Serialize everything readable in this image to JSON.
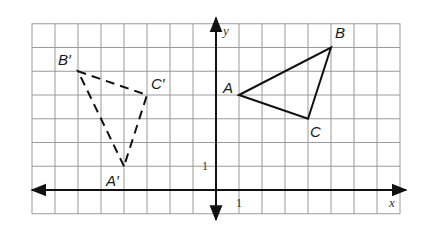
{
  "diagram": {
    "type": "coordinate-plane-reflection",
    "grid": {
      "x_min": -8,
      "x_max": 8,
      "y_min": -1,
      "y_max": 7,
      "origin_px": [
        216,
        190
      ],
      "cell_w": 23,
      "cell_h": 23.75,
      "line_color": "#9a9a9a",
      "axis_color": "#111111"
    },
    "axes": {
      "x_label": "x",
      "y_label": "y",
      "x_tick_label": "1",
      "y_tick_label": "1"
    },
    "triangles": [
      {
        "name": "ABC",
        "style": "solid",
        "color": "#111111",
        "vertices": [
          {
            "label": "A",
            "x": 1,
            "y": 4
          },
          {
            "label": "B",
            "x": 5,
            "y": 6
          },
          {
            "label": "C",
            "x": 4,
            "y": 3
          }
        ]
      },
      {
        "name": "A'B'C'",
        "style": "dashed",
        "color": "#111111",
        "vertices": [
          {
            "label": "A′",
            "x": -4,
            "y": 1
          },
          {
            "label": "B′",
            "x": -6,
            "y": 5
          },
          {
            "label": "C′",
            "x": -3,
            "y": 4
          }
        ]
      }
    ]
  }
}
